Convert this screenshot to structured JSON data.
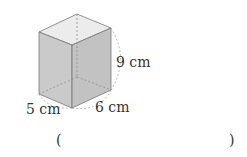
{
  "figure": {
    "shape": "rectangular-prism",
    "dimensions": {
      "height": "9 cm",
      "width": "6 cm",
      "depth": "5 cm"
    }
  },
  "answer_blank": {
    "open_paren": "(",
    "close_paren": ")",
    "value": ""
  },
  "colors": {
    "front_face": "#c9c9c9",
    "right_face": "#bdbdbd",
    "top_face": "#e8e8e8",
    "edge": "#777777"
  }
}
